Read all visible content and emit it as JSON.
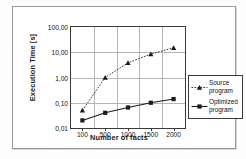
{
  "chart_data": {
    "type": "line",
    "title": "",
    "xlabel": "Number of facts",
    "ylabel": "Execution Time [s]",
    "yscale": "log",
    "ylim": [
      0.01,
      100.0
    ],
    "grid": true,
    "legend_position": "right",
    "categories": [
      "100",
      "500",
      "1000",
      "1500",
      "2000"
    ],
    "x": [
      100,
      500,
      1000,
      1500,
      2000
    ],
    "xtick_labels": [
      "100",
      "500",
      "1000",
      "1500",
      "2000"
    ],
    "ytick_labels": [
      "100,00",
      "10,00",
      "1,00",
      "0,10",
      "0,01"
    ],
    "ytick_values": [
      100.0,
      10.0,
      1.0,
      0.1,
      0.01
    ],
    "series": [
      {
        "name": "Source program",
        "legend_label_line1": "Source",
        "legend_label_line2": "program",
        "marker": "triangle",
        "linestyle": "dotted",
        "color": "#1a1a1a",
        "values": [
          0.05,
          1.0,
          3.8,
          8.5,
          15.0
        ]
      },
      {
        "name": "Optimized program",
        "legend_label_line1": "Optimized",
        "legend_label_line2": "program",
        "marker": "square",
        "linestyle": "solid",
        "color": "#1a1a1a",
        "values": [
          0.02,
          0.04,
          0.065,
          0.1,
          0.14
        ]
      }
    ]
  },
  "figure": {
    "frame_color": "#9a9a9a",
    "axis_color": "#3a3a3a",
    "grid_color": "#b6b6b6",
    "background": "#ffffff"
  }
}
